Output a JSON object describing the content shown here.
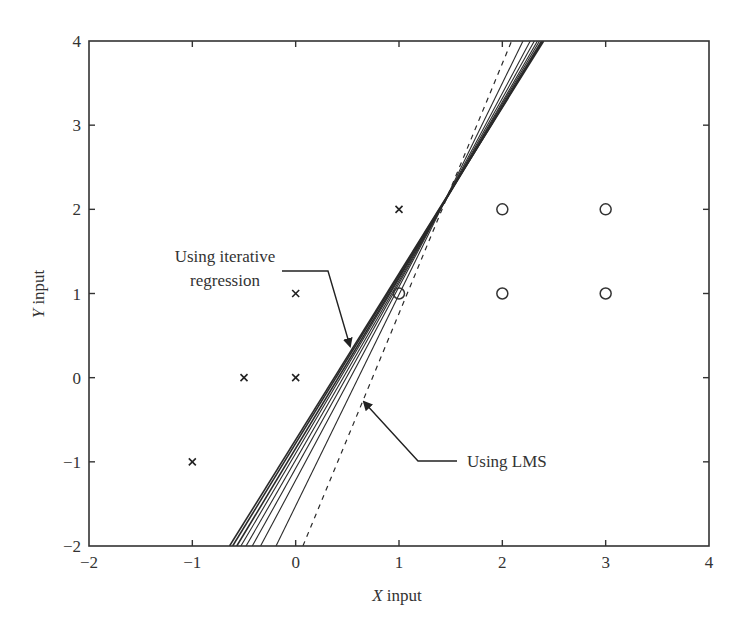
{
  "chart_data": {
    "type": "scatter",
    "title": "",
    "xlabel": "X input",
    "ylabel": "Y input",
    "xlim": [
      -2,
      4
    ],
    "ylim": [
      -2,
      4
    ],
    "xticks": [
      -2,
      -1,
      0,
      1,
      2,
      3,
      4
    ],
    "yticks": [
      -2,
      -1,
      0,
      1,
      2,
      3,
      4
    ],
    "xtick_labels": [
      "−2",
      "−1",
      "0",
      "1",
      "2",
      "3",
      "4"
    ],
    "ytick_labels": [
      "−2",
      "−1",
      "0",
      "1",
      "2",
      "3",
      "4"
    ],
    "grid": false,
    "series": [
      {
        "name": "Class 1 (x markers)",
        "marker": "x",
        "points": [
          [
            -1,
            -1
          ],
          [
            -0.5,
            0
          ],
          [
            0,
            0
          ],
          [
            0,
            1
          ],
          [
            1,
            2
          ]
        ]
      },
      {
        "name": "Class 2 (o markers)",
        "marker": "o",
        "points": [
          [
            1,
            1
          ],
          [
            2,
            1
          ],
          [
            3,
            1
          ],
          [
            2,
            2
          ],
          [
            3,
            2
          ]
        ]
      },
      {
        "name": "Using iterative regression",
        "style": "solid",
        "lines": [
          {
            "x_at_ymin": -0.64,
            "x_at_ymax": 2.4
          },
          {
            "x_at_ymin": -0.61,
            "x_at_ymax": 2.39
          },
          {
            "x_at_ymin": -0.57,
            "x_at_ymax": 2.38
          },
          {
            "x_at_ymin": -0.53,
            "x_at_ymax": 2.36
          },
          {
            "x_at_ymin": -0.48,
            "x_at_ymax": 2.34
          },
          {
            "x_at_ymin": -0.42,
            "x_at_ymax": 2.31
          },
          {
            "x_at_ymin": -0.34,
            "x_at_ymax": 2.27
          },
          {
            "x_at_ymin": -0.19,
            "x_at_ymax": 2.2
          }
        ]
      },
      {
        "name": "Using LMS",
        "style": "dashed",
        "lines": [
          {
            "x_at_ymin": 0.07,
            "x_at_ymax": 2.09
          }
        ]
      }
    ],
    "annotations": [
      {
        "text_lines": [
          "Using iterative",
          "regression"
        ],
        "arrow_to": [
          0.58,
          0.38
        ]
      },
      {
        "text": "Using LMS",
        "arrow_to": [
          0.7,
          -0.27
        ]
      }
    ]
  },
  "labels": {
    "xlabel_italic": "X",
    "xlabel_rest": " input",
    "ylabel_italic": "Y",
    "ylabel_rest": " input",
    "annot_iter_line1": "Using iterative",
    "annot_iter_line2": "regression",
    "annot_lms": "Using LMS"
  }
}
